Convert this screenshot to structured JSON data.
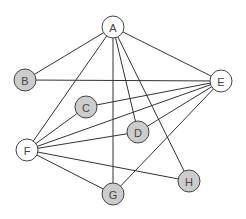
{
  "graph": {
    "colors": {
      "filled": "#cccccc",
      "empty": "#ffffff",
      "edge": "#333333",
      "stroke": "#444444"
    },
    "nodes": [
      {
        "id": "A",
        "label": "A",
        "x": 113,
        "y": 27,
        "filled": false
      },
      {
        "id": "B",
        "label": "B",
        "x": 25,
        "y": 80,
        "filled": true
      },
      {
        "id": "C",
        "label": "C",
        "x": 86,
        "y": 107,
        "filled": true
      },
      {
        "id": "D",
        "label": "D",
        "x": 138,
        "y": 132,
        "filled": true
      },
      {
        "id": "E",
        "label": "E",
        "x": 221,
        "y": 81,
        "filled": false
      },
      {
        "id": "F",
        "label": "F",
        "x": 27,
        "y": 150,
        "filled": false
      },
      {
        "id": "G",
        "label": "G",
        "x": 113,
        "y": 194,
        "filled": true
      },
      {
        "id": "H",
        "label": "H",
        "x": 189,
        "y": 181,
        "filled": true
      }
    ],
    "edges": [
      [
        "A",
        "B"
      ],
      [
        "A",
        "F"
      ],
      [
        "A",
        "G"
      ],
      [
        "A",
        "D"
      ],
      [
        "A",
        "H"
      ],
      [
        "A",
        "E"
      ],
      [
        "B",
        "E"
      ],
      [
        "C",
        "E"
      ],
      [
        "C",
        "F"
      ],
      [
        "D",
        "E"
      ],
      [
        "D",
        "F"
      ],
      [
        "E",
        "F"
      ],
      [
        "E",
        "G"
      ],
      [
        "F",
        "H"
      ],
      [
        "F",
        "G"
      ]
    ]
  }
}
